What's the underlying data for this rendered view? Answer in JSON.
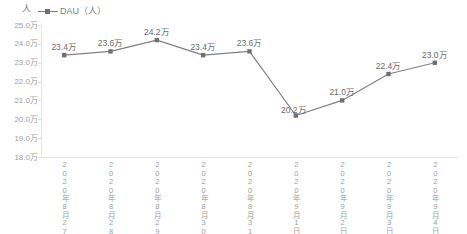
{
  "chart_data": {
    "type": "line",
    "title": "",
    "xlabel": "",
    "ylabel": "人",
    "ylim": [
      180000,
      250000
    ],
    "ytick_labels": [
      "25.0万",
      "24.0万",
      "23.0万",
      "22.0万",
      "21.0万",
      "20.0万",
      "19.0万",
      "18.0万"
    ],
    "ytick_values": [
      250000,
      240000,
      230000,
      220000,
      210000,
      200000,
      190000,
      180000
    ],
    "grid": false,
    "legend_position": "top-left",
    "categories": [
      "2020年8月27日",
      "2020年8月28日",
      "2020年8月29日",
      "2020年8月30日",
      "2020年8月31日",
      "2020年9月1日",
      "2020年9月2日",
      "2020年9月3日",
      "2020年9月4日"
    ],
    "series": [
      {
        "name": "DAU（人）",
        "values": [
          234000,
          236000,
          242000,
          234000,
          236000,
          202000,
          210000,
          224000,
          230000
        ],
        "data_labels": [
          "23.4万",
          "23.6万",
          "24.2万",
          "23.4万",
          "23.6万",
          "20.2万",
          "21.0万",
          "22.4万",
          "23.0万"
        ],
        "color": "#808080",
        "marker_color": "#6f6f6f"
      }
    ]
  },
  "axis": {
    "y_title": "人"
  },
  "legend": {
    "entries": [
      {
        "label": "DAU（人）",
        "marker": "line-square-marker"
      }
    ]
  },
  "colors": {
    "series_line": "#808080",
    "marker": "#6f6f6f",
    "axis": "#e3e3e3",
    "tick_text": "#9d9d9d",
    "label_text": "#6b6b6b",
    "background": "#ffffff"
  }
}
